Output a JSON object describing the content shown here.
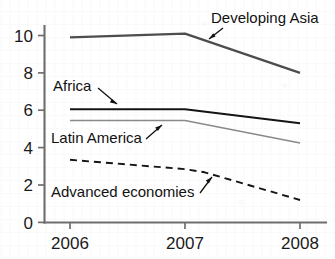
{
  "chart_data": {
    "type": "line",
    "title": "",
    "xlabel": "",
    "ylabel": "",
    "x": [
      "2006",
      "2007",
      "2008"
    ],
    "xticklabels": [
      "2006",
      "2007",
      "2008"
    ],
    "yticklabels": [
      "0",
      "2",
      "4",
      "6",
      "8",
      "10"
    ],
    "yticks": [
      0,
      2,
      4,
      6,
      8,
      10
    ],
    "ylim": [
      0,
      11
    ],
    "xlim": [
      2005.75,
      2008.3
    ],
    "grid": false,
    "legend": "inline-annotations",
    "series": [
      {
        "name": "Developing Asia",
        "values": [
          9.9,
          10.1,
          8.0
        ],
        "style": "solid",
        "color": "#4d4d4d",
        "width": 2.3
      },
      {
        "name": "Africa",
        "values": [
          6.05,
          6.05,
          5.3
        ],
        "style": "solid",
        "color": "#141414",
        "width": 1.9
      },
      {
        "name": "Latin America",
        "values": [
          5.45,
          5.45,
          4.25
        ],
        "style": "solid",
        "color": "#8a8a8a",
        "width": 1.6
      },
      {
        "name": "Advanced economies",
        "values": [
          3.35,
          2.85,
          1.2
        ],
        "style": "dashed",
        "color": "#141414",
        "width": 1.9,
        "note": "bends more steeply downward after 2007"
      }
    ],
    "annotations": [
      {
        "text": "Developing Asia",
        "series": "Developing Asia",
        "has_arrow": true
      },
      {
        "text": "Africa",
        "series": "Africa",
        "has_arrow": true
      },
      {
        "text": "Latin America",
        "series": "Latin America",
        "has_arrow": true
      },
      {
        "text": "Advanced economies",
        "series": "Advanced economies",
        "has_arrow": true
      }
    ]
  }
}
